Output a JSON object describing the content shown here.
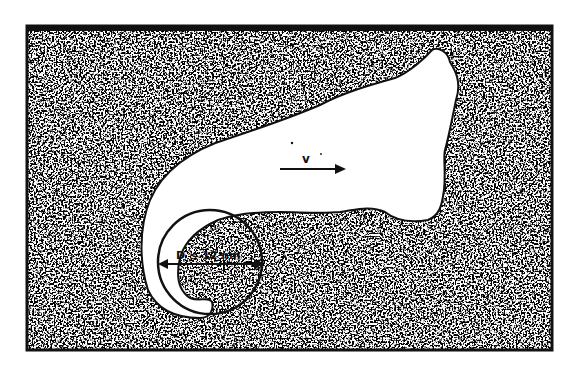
{
  "figure": {
    "background_color": "#ffffff",
    "ink_color": "#111111",
    "frame": {
      "x": 27,
      "y": 26,
      "width": 525,
      "height": 324
    }
  },
  "labels": {
    "velocity": "v",
    "diameter": "D ≲ 12 nm",
    "diameter_symbol": "D",
    "diameter_relation": "≲",
    "diameter_value": "12 nm"
  },
  "elements": {
    "void_region": "defect-free-void",
    "matrix": "stippled-matrix",
    "probe_circle": {
      "cx": 210,
      "cy": 262,
      "r": 52
    },
    "velocity_arrow": {
      "x1": 280,
      "y1": 168,
      "x2": 345,
      "y2": 168
    },
    "diameter_arrow": {
      "x1": 160,
      "y1": 264,
      "x2": 262,
      "y2": 264
    }
  }
}
